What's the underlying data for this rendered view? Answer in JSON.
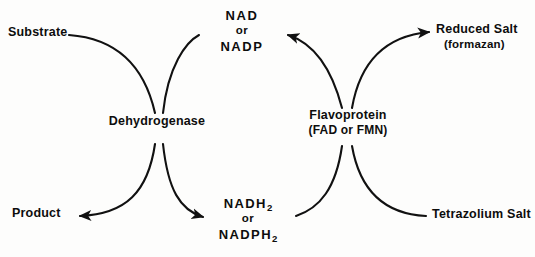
{
  "diagram": {
    "stroke_color": "#111111",
    "background_color": "#fdfdfc",
    "labels": {
      "substrate": "Substrate",
      "product": "Product",
      "dehydrogenase": "Dehydrogenase",
      "flavoprotein": "Flavoprotein",
      "flavoprotein_cofactors": "(FAD or FMN)",
      "nad_top": "NAD",
      "nad_or": "or",
      "nad_bottom": "NADP",
      "nadh_top": "NADH",
      "nadh_top_sub": "2",
      "nadh_or": "or",
      "nadh_bottom": "NADPH",
      "nadh_bottom_sub": "2",
      "reduced_salt": "Reduced Salt",
      "reduced_salt_alt": "(formazan)",
      "tetrazolium_salt": "Tetrazolium Salt"
    },
    "arrows": [
      {
        "name": "substrate-to-dehydrogenase",
        "from": "Substrate",
        "to": "Dehydrogenase",
        "arrowhead": false
      },
      {
        "name": "dehydrogenase-to-nad",
        "from": "Dehydrogenase",
        "to": "NAD or NADP",
        "arrowhead": false
      },
      {
        "name": "dehydrogenase-to-product",
        "from": "Dehydrogenase",
        "to": "Product",
        "arrowhead": true
      },
      {
        "name": "dehydrogenase-to-nadh",
        "from": "Dehydrogenase",
        "to": "NADH2 or NADPH2",
        "arrowhead": true
      },
      {
        "name": "nad-to-flavoprotein",
        "from": "NAD or NADP",
        "to": "Flavoprotein",
        "arrowhead": true
      },
      {
        "name": "flavoprotein-to-reduced-salt",
        "from": "Flavoprotein",
        "to": "Reduced Salt",
        "arrowhead": true
      },
      {
        "name": "nadh-to-flavoprotein",
        "from": "NADH2 or NADPH2",
        "to": "Flavoprotein",
        "arrowhead": false
      },
      {
        "name": "tetrazolium-to-flavoprotein",
        "from": "Tetrazolium Salt",
        "to": "Flavoprotein",
        "arrowhead": false
      }
    ]
  }
}
